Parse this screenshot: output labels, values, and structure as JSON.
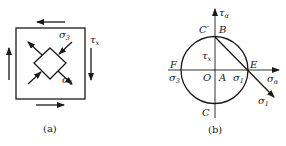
{
  "figure_a": {
    "caption": "(a)",
    "labels": {
      "sigma3": {
        "base": "σ",
        "sub": "3"
      },
      "sigma1": {
        "base": "σ",
        "sub": "1"
      },
      "tau_x": {
        "base": "τ",
        "sub": "x"
      }
    }
  },
  "figure_b": {
    "caption": "(b)",
    "axes": {
      "horizontal": {
        "base": "σ",
        "sub": "α"
      },
      "vertical": {
        "base": "τ",
        "sub": "α"
      }
    },
    "points": {
      "C_prime": "C′",
      "B": "B",
      "F": "F",
      "E": "E",
      "O": "O",
      "A": "A",
      "C": "C"
    },
    "labels": {
      "tau_x": {
        "base": "τ",
        "sub": "x"
      },
      "sigma3": {
        "base": "σ",
        "sub": "3"
      },
      "sigma1_axis": {
        "base": "σ",
        "sub": "1"
      },
      "sigma1_arrow": {
        "base": "σ",
        "sub": "1"
      }
    }
  },
  "colors": {
    "stroke": "#1a1a1a",
    "background": "#ffffff"
  }
}
